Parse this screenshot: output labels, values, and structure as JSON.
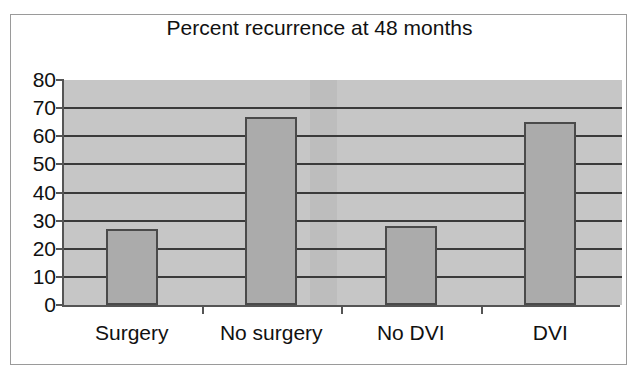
{
  "chart_data": {
    "type": "bar",
    "title": "Percent recurrence at 48 months",
    "xlabel": "",
    "ylabel": "",
    "categories": [
      "Surgery",
      "No surgery",
      "No DVI",
      "DVI"
    ],
    "values": [
      27,
      67,
      28,
      65
    ],
    "ylim": [
      0,
      80
    ],
    "ytick_step": 10,
    "yticks": [
      0,
      10,
      20,
      30,
      40,
      50,
      60,
      70,
      80
    ],
    "ytick_labels": [
      "0",
      "10",
      "20",
      "30",
      "40",
      "50",
      "60",
      "70",
      "80"
    ],
    "grid": true,
    "grid_axis": "y",
    "legend": false,
    "legend_position": "none",
    "series": [
      {
        "name": "Percent recurrence",
        "values": [
          27,
          67,
          28,
          65
        ]
      }
    ]
  },
  "style": {
    "plot_background": "#c6c6c6",
    "bar_fill": "#ababab",
    "bar_border": "#4a4a4a",
    "gridline_color": "#3a3a3a",
    "axis_color": "#555555",
    "text_color": "#111111",
    "page_background": "#ffffff",
    "frame_border": "#9a9a9a"
  }
}
